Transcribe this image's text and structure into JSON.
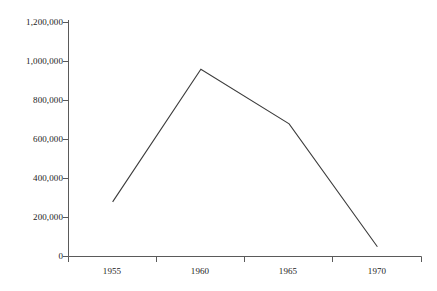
{
  "chart_data": {
    "type": "line",
    "title": "",
    "subtitle": "",
    "xlabel": "",
    "ylabel": "",
    "categories": [
      "1955",
      "1960",
      "1965",
      "1970"
    ],
    "values": [
      280000,
      960000,
      680000,
      50000
    ],
    "series": [
      {
        "name": "",
        "values": [
          280000,
          960000,
          680000,
          50000
        ]
      }
    ],
    "ylim": [
      0,
      1200000
    ],
    "y_ticks": [
      0,
      200000,
      400000,
      600000,
      800000,
      1000000,
      1200000
    ],
    "y_tick_labels": [
      "0",
      "200,000",
      "400,000",
      "600,000",
      "800,000",
      "1,000,000",
      "1,200,000"
    ],
    "x_tick_labels": [
      "1955",
      "1960",
      "1965",
      "1970"
    ],
    "grid": false,
    "legend": "none",
    "annotations": [],
    "colors": {
      "line": "#3c3c3c",
      "axis": "#5a5a5a",
      "text": "#1b1b1b",
      "background": "#ffffff"
    }
  }
}
